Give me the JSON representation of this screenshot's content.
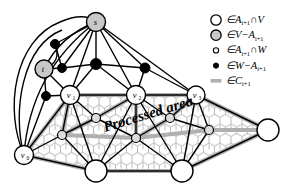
{
  "figure": {
    "title": "",
    "processed_area_label": "Processed area",
    "background_color": "#ffffff"
  },
  "colors": {
    "edge": "#000000",
    "cut_edge": "#b0b0b0",
    "node_fill_white": "#ffffff",
    "node_fill_gray": "#c8c8c8",
    "node_fill_black": "#000000",
    "node_stroke": "#000000",
    "texture": "#bdbdbd",
    "text": "#000000"
  },
  "legend": {
    "items": [
      {
        "marker": "large-open-circle",
        "marker_kind": "circle-open-large",
        "text": "∈A",
        "sub": "i+1",
        "text2": "∩V"
      },
      {
        "marker": "large-gray-circle",
        "marker_kind": "circle-gray-large",
        "text": "∈V−A",
        "sub": "i+1",
        "text2": ""
      },
      {
        "marker": "small-open-circle",
        "marker_kind": "circle-open-small",
        "text": "∈A",
        "sub": "i+1",
        "text2": "∩W"
      },
      {
        "marker": "small-filled-circle",
        "marker_kind": "circle-filled-small",
        "text": "∈W−A",
        "sub": "i+1",
        "text2": ""
      },
      {
        "marker": "gray-line",
        "marker_kind": "line-gray",
        "text": "∈C",
        "sub": "i+1",
        "text2": ""
      }
    ]
  },
  "graph": {
    "nodes": [
      {
        "id": "s",
        "label": "s",
        "sub": "",
        "x": 96,
        "y": 22,
        "r": 9.5,
        "kind": "gray-large"
      },
      {
        "id": "t",
        "label": "t",
        "sub": "",
        "x": 44,
        "y": 69,
        "r": 9.0,
        "kind": "gray-large"
      },
      {
        "id": "v1",
        "label": "v",
        "sub": "1",
        "x": 70,
        "y": 95,
        "r": 9.5,
        "kind": "open-large"
      },
      {
        "id": "v2",
        "label": "v",
        "sub": "2",
        "x": 136,
        "y": 95,
        "r": 9.5,
        "kind": "open-large"
      },
      {
        "id": "v3",
        "label": "v",
        "sub": "3",
        "x": 196,
        "y": 95,
        "r": 9.0,
        "kind": "open-large"
      },
      {
        "id": "v0",
        "label": "v",
        "sub": "0",
        "x": 24,
        "y": 155,
        "r": 9.5,
        "kind": "open-large"
      },
      {
        "id": "b1",
        "label": "",
        "sub": "",
        "x": 96,
        "y": 171,
        "r": 11.0,
        "kind": "open-large"
      },
      {
        "id": "b2",
        "label": "",
        "sub": "",
        "x": 182,
        "y": 171,
        "r": 11.0,
        "kind": "open-large"
      },
      {
        "id": "b3",
        "label": "",
        "sub": "",
        "x": 268,
        "y": 130,
        "r": 11.0,
        "kind": "open-large"
      },
      {
        "id": "w1",
        "label": "",
        "sub": "",
        "x": 62,
        "y": 135,
        "r": 4.5,
        "kind": "open-small"
      },
      {
        "id": "w2",
        "label": "",
        "sub": "",
        "x": 96,
        "y": 118,
        "r": 4.5,
        "kind": "open-small"
      },
      {
        "id": "w3",
        "label": "",
        "sub": "",
        "x": 136,
        "y": 138,
        "r": 4.5,
        "kind": "open-small"
      },
      {
        "id": "w4",
        "label": "",
        "sub": "",
        "x": 170,
        "y": 118,
        "r": 4.5,
        "kind": "open-small"
      },
      {
        "id": "w5",
        "label": "",
        "sub": "",
        "x": 209,
        "y": 130,
        "r": 4.5,
        "kind": "open-small"
      },
      {
        "id": "k1",
        "label": "",
        "sub": "",
        "x": 55,
        "y": 44,
        "r": 4.5,
        "kind": "filled-small"
      },
      {
        "id": "k2",
        "label": "",
        "sub": "",
        "x": 62,
        "y": 68,
        "r": 4.5,
        "kind": "filled-small"
      },
      {
        "id": "k3",
        "label": "",
        "sub": "",
        "x": 96,
        "y": 64,
        "r": 5.5,
        "kind": "filled-small"
      },
      {
        "id": "k4",
        "label": "",
        "sub": "",
        "x": 145,
        "y": 68,
        "r": 5.0,
        "kind": "filled-small"
      },
      {
        "id": "k5",
        "label": "",
        "sub": "",
        "x": 46,
        "y": 96,
        "r": 4.5,
        "kind": "filled-small"
      }
    ],
    "edges_black": [
      [
        "s",
        "t"
      ],
      [
        "s",
        "k1"
      ],
      [
        "s",
        "k2"
      ],
      [
        "s",
        "k3"
      ],
      [
        "s",
        "k4"
      ],
      [
        "s",
        "v1"
      ],
      [
        "s",
        "v2"
      ],
      [
        "s",
        "v3"
      ],
      [
        "s",
        "v0"
      ],
      [
        "t",
        "k1"
      ],
      [
        "t",
        "k2"
      ],
      [
        "t",
        "k5"
      ],
      [
        "t",
        "v1"
      ],
      [
        "k1",
        "k2"
      ],
      [
        "k2",
        "k3"
      ],
      [
        "k3",
        "k4"
      ],
      [
        "k3",
        "v1"
      ],
      [
        "k3",
        "v2"
      ],
      [
        "k4",
        "v2"
      ],
      [
        "k4",
        "v3"
      ],
      [
        "k5",
        "v1"
      ],
      [
        "k5",
        "v0"
      ],
      [
        "v1",
        "v2"
      ],
      [
        "v2",
        "v3"
      ],
      [
        "v1",
        "w1"
      ],
      [
        "v1",
        "w2"
      ],
      [
        "v1",
        "b1"
      ],
      [
        "v1",
        "v0"
      ],
      [
        "v2",
        "w2"
      ],
      [
        "v2",
        "w3"
      ],
      [
        "v2",
        "w4"
      ],
      [
        "v2",
        "b1"
      ],
      [
        "v2",
        "b2"
      ],
      [
        "v3",
        "w4"
      ],
      [
        "v3",
        "w5"
      ],
      [
        "v3",
        "b2"
      ],
      [
        "v3",
        "b3"
      ],
      [
        "v0",
        "w1"
      ],
      [
        "v0",
        "b1"
      ],
      [
        "w1",
        "w2"
      ],
      [
        "w2",
        "w3"
      ],
      [
        "w3",
        "w4"
      ],
      [
        "w4",
        "w5"
      ],
      [
        "w1",
        "b1"
      ],
      [
        "w3",
        "b1"
      ],
      [
        "w3",
        "b2"
      ],
      [
        "w5",
        "b2"
      ],
      [
        "b1",
        "b2"
      ],
      [
        "b2",
        "b3"
      ]
    ],
    "edges_cut": [
      [
        "v0",
        "v1"
      ],
      [
        "v1",
        "v2"
      ],
      [
        "v2",
        "v3"
      ],
      [
        "v3",
        "b3"
      ],
      [
        "b3",
        "b2"
      ],
      [
        "b2",
        "b1"
      ],
      [
        "b1",
        "v0"
      ],
      [
        "v1",
        "w1"
      ],
      [
        "w1",
        "w3"
      ],
      [
        "w3",
        "w4"
      ],
      [
        "w4",
        "v3"
      ],
      [
        "v2",
        "w3"
      ],
      [
        "w3",
        "w5"
      ],
      [
        "w5",
        "b3"
      ],
      [
        "v2",
        "w2"
      ],
      [
        "w2",
        "w1"
      ]
    ]
  },
  "labels": {
    "s": "s",
    "t": "t",
    "v0": "v0",
    "v1": "v1",
    "v2": "v2",
    "v3": "v3"
  }
}
